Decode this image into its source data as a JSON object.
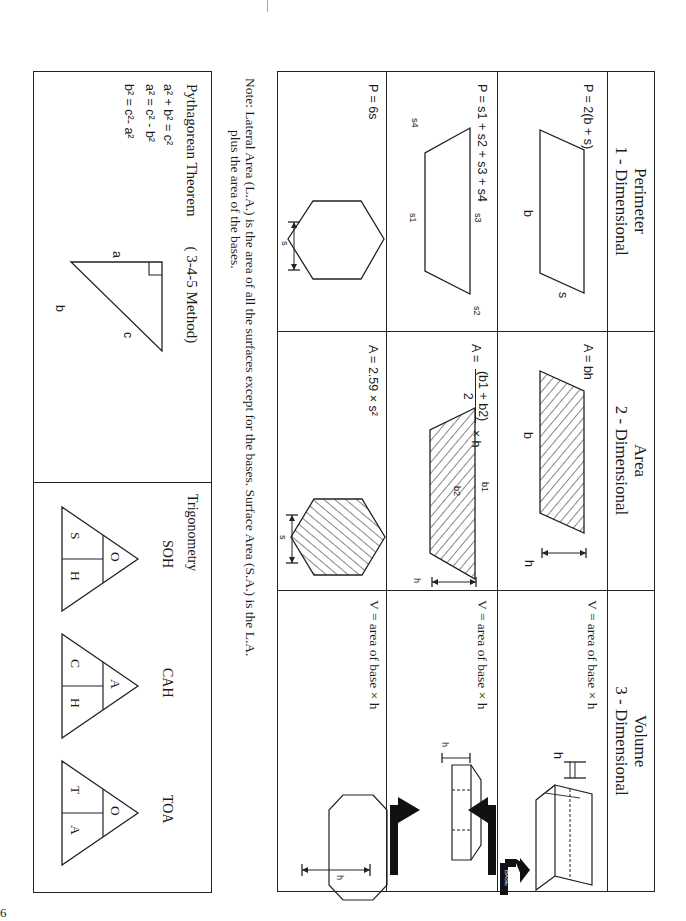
{
  "page": {
    "orientation": "rotated-90-clockwise",
    "page_number": "6"
  },
  "table": {
    "columns": [
      {
        "title": "Perimeter",
        "subtitle": "1 - Dimensional"
      },
      {
        "title": "Area",
        "subtitle": "2 - Dimensional"
      },
      {
        "title": "Volume",
        "subtitle": "3 - Dimensional"
      }
    ],
    "rows": [
      {
        "shape": "parallelogram",
        "perimeter": {
          "formula": "P = 2(b + s)",
          "labels": [
            "b",
            "s"
          ]
        },
        "area": {
          "formula": "A = bh",
          "labels": [
            "b",
            "h"
          ]
        },
        "volume": {
          "formula": "V = area of base × h",
          "labels": [
            "h",
            "BASE"
          ]
        }
      },
      {
        "shape": "trapezoid",
        "perimeter": {
          "formula": "P = s1 + s2 + s3 + s4",
          "labels": [
            "s1",
            "s2",
            "s3",
            "s4"
          ]
        },
        "area": {
          "formula_prefix": "A =",
          "numerator": "(b1 + b2)",
          "denominator": "2",
          "suffix": "× h",
          "labels": [
            "b1",
            "b2",
            "h"
          ]
        },
        "volume": {
          "formula": "V = area of base × h",
          "labels": [
            "h",
            "BASE",
            "BASE"
          ]
        }
      },
      {
        "shape": "hexagon",
        "perimeter": {
          "formula": "P = 6s",
          "labels": [
            "s"
          ]
        },
        "area": {
          "formula": "A = 2.59 × s²",
          "labels": [
            "s"
          ]
        },
        "volume": {
          "formula": "V = area of base × h",
          "labels": [
            "h"
          ]
        }
      }
    ]
  },
  "note": {
    "line1": "Note: Lateral Area (L.A.) is the area of all the surfaces except for the bases. Surface Area (S.A.) is the L.A.",
    "line2": "plus the area of the bases."
  },
  "pythagorean": {
    "title": "Pythagorean Theorem",
    "method": "( 3-4-5 Method)",
    "formulas": [
      "a² + b² = c²",
      "a² = c² - b²",
      "b² = c²- a²"
    ],
    "labels": {
      "a": "a",
      "b": "b",
      "c": "c"
    }
  },
  "trigonometry": {
    "title": "Trigonometry",
    "triangles": [
      {
        "name": "SOH",
        "top": "O",
        "bottom_left": "S",
        "bottom_right": "H"
      },
      {
        "name": "CAH",
        "top": "A",
        "bottom_left": "C",
        "bottom_right": "H"
      },
      {
        "name": "TOA",
        "top": "O",
        "bottom_left": "T",
        "bottom_right": "A"
      }
    ]
  }
}
